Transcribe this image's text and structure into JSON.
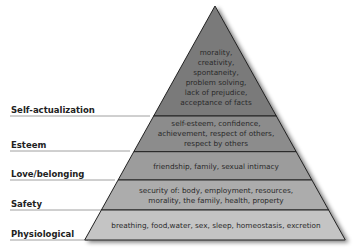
{
  "levels": [
    {
      "name": "Self-actualization",
      "fill": "#7a7a7a",
      "lines": [
        "morality,",
        "creativity,",
        "spontaneity,",
        "problem solving,",
        "lack of prejudice,",
        "acceptance of facts"
      ]
    },
    {
      "name": "Esteem",
      "fill": "#8c8c8c",
      "lines": [
        "self-esteem, confidence,",
        "achievement, respect of others,",
        "respect by others"
      ]
    },
    {
      "name": "Love/belonging",
      "fill": "#9c9c9c",
      "lines": [
        "friendship, family, sexual intimacy"
      ]
    },
    {
      "name": "Safety",
      "fill": "#acacac",
      "lines": [
        "security of: body, employment, resources,",
        "morality, the family, health, property"
      ]
    },
    {
      "name": "Physiological",
      "fill": "#c4c4c4",
      "lines": [
        "breathing, food,water, sex, sleep, homeostasis, excretion"
      ]
    }
  ]
}
